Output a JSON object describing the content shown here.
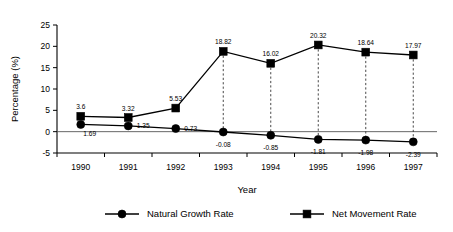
{
  "chart_data": {
    "type": "line",
    "title": "",
    "xlabel": "Year",
    "ylabel": "Percentage (%)",
    "categories": [
      "1990",
      "1991",
      "1992",
      "1993",
      "1994",
      "1995",
      "1996",
      "1997"
    ],
    "x": [
      1990,
      1991,
      1992,
      1993,
      1994,
      1995,
      1996,
      1997
    ],
    "ylim": [
      -5,
      25
    ],
    "yticks": [
      -5,
      0,
      5,
      10,
      15,
      20,
      25
    ],
    "ytick_labels": [
      "-5",
      "0",
      "5",
      "10",
      "15",
      "20",
      "25"
    ],
    "grid": false,
    "zero_line": true,
    "legend_position": "bottom",
    "series": [
      {
        "name": "Natural Growth Rate",
        "marker": "circle",
        "color": "#000000",
        "values": [
          1.69,
          1.35,
          0.73,
          -0.08,
          -0.85,
          -1.81,
          -1.98,
          -2.39
        ],
        "labels": [
          "1.69",
          "1.35",
          "0.73",
          "-0.08",
          "-0.85",
          "-1.81",
          "-1.98",
          "-2.39"
        ]
      },
      {
        "name": "Net Movement Rate",
        "marker": "square",
        "color": "#000000",
        "values": [
          3.6,
          3.32,
          5.53,
          18.82,
          16.02,
          20.32,
          18.64,
          17.97
        ],
        "labels": [
          "3.6",
          "3.32",
          "5.53",
          "18.82",
          "16.02",
          "20.32",
          "18.64",
          "17.97"
        ]
      }
    ],
    "connectors": {
      "style": "dashed",
      "at_categories": [
        "1993",
        "1994",
        "1995",
        "1996",
        "1997"
      ]
    }
  },
  "legend": {
    "items": [
      {
        "label": "Natural Growth Rate",
        "marker": "circle"
      },
      {
        "label": "Net Movement Rate",
        "marker": "square"
      }
    ]
  }
}
